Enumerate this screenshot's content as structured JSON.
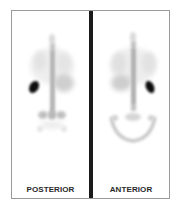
{
  "figure": {
    "type": "nuclear-medicine-scintigraphy",
    "panels": [
      {
        "id": "posterior",
        "label": "POSTERIOR",
        "spleen_side": "left"
      },
      {
        "id": "anterior",
        "label": "ANTERIOR",
        "spleen_side": "right"
      }
    ],
    "colors": {
      "background": "#ffffff",
      "border": "#9a9a9a",
      "divider": "#1a1a1a",
      "hot_spot": "#0a0a0a",
      "label": "#2a2a2a"
    }
  }
}
